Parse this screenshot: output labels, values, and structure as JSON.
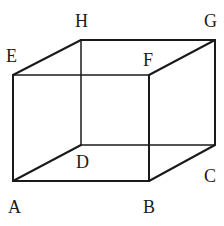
{
  "diagram": {
    "type": "cuboid",
    "vertices": [
      {
        "name": "A",
        "label": "A",
        "x": 13,
        "y": 181,
        "lx": 8,
        "ly": 213
      },
      {
        "name": "B",
        "label": "B",
        "x": 149,
        "y": 181,
        "lx": 143,
        "ly": 213
      },
      {
        "name": "C",
        "label": "C",
        "x": 215,
        "y": 145,
        "lx": 204,
        "ly": 182
      },
      {
        "name": "D",
        "label": "D",
        "x": 81,
        "y": 145,
        "lx": 76,
        "ly": 168
      },
      {
        "name": "E",
        "label": "E",
        "x": 13,
        "y": 75,
        "lx": 6,
        "ly": 62
      },
      {
        "name": "F",
        "label": "F",
        "x": 149,
        "y": 75,
        "lx": 143,
        "ly": 66
      },
      {
        "name": "G",
        "label": "G",
        "x": 215,
        "y": 40,
        "lx": 204,
        "ly": 27
      },
      {
        "name": "H",
        "label": "H",
        "x": 81,
        "y": 40,
        "lx": 75,
        "ly": 27
      }
    ],
    "edges": [
      [
        "A",
        "B"
      ],
      [
        "B",
        "C"
      ],
      [
        "C",
        "D"
      ],
      [
        "D",
        "A"
      ],
      [
        "E",
        "F"
      ],
      [
        "F",
        "G"
      ],
      [
        "G",
        "H"
      ],
      [
        "H",
        "E"
      ],
      [
        "A",
        "E"
      ],
      [
        "B",
        "F"
      ],
      [
        "C",
        "G"
      ],
      [
        "D",
        "H"
      ]
    ]
  }
}
